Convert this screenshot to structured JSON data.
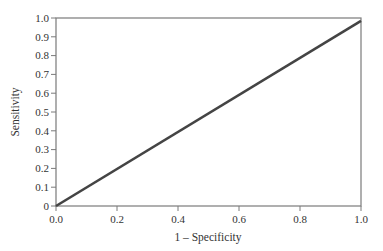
{
  "chart_data": {
    "type": "line",
    "title": "",
    "xlabel": "1 – Specificity",
    "ylabel": "Sensitivity",
    "xlim": [
      0,
      1.0
    ],
    "ylim": [
      0,
      1.0
    ],
    "x_ticks": [
      "0.0",
      "0.2",
      "0.4",
      "0.6",
      "0.8",
      "1.0"
    ],
    "y_ticks": [
      "0",
      "0.1",
      "0.2",
      "0.3",
      "0.4",
      "0.5",
      "0.6",
      "0.7",
      "0.8",
      "0.9",
      "1.0"
    ],
    "grid": false,
    "legend": null,
    "series": [
      {
        "name": "ROC curve",
        "x": [
          0.0,
          1.0
        ],
        "y": [
          0.0,
          0.985
        ],
        "color": "#444444"
      }
    ]
  },
  "style": {
    "frame_color": "#7a7a7a",
    "line_color": "#444444",
    "text_color": "#333333"
  }
}
